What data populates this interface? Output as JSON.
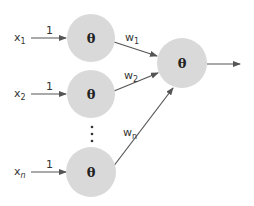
{
  "diagram": {
    "title": "",
    "node_symbol": "θ",
    "colors": {
      "node_fill": "#d9d9d9",
      "edge": "#555555",
      "text": "#333333",
      "background": "#ffffff"
    },
    "inputs": [
      {
        "var": "x",
        "sub": "1",
        "weight_label": "1"
      },
      {
        "var": "x",
        "sub": "2",
        "weight_label": "1"
      },
      {
        "var": "x",
        "sub": "n",
        "weight_label": "1"
      }
    ],
    "hidden_nodes": [
      {
        "label": "θ"
      },
      {
        "label": "θ"
      },
      {
        "label": "θ"
      }
    ],
    "output_weights": [
      {
        "var": "w",
        "sub": "1"
      },
      {
        "var": "w",
        "sub": "2"
      },
      {
        "var": "w",
        "sub": "n"
      }
    ],
    "output_node": {
      "label": "θ"
    },
    "ellipsis": "⋮"
  }
}
